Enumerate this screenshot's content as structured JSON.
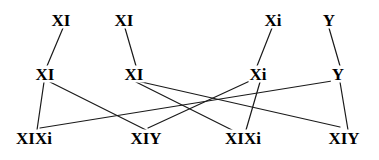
{
  "diagram": {
    "type": "genetic-cross-lattice",
    "title": "",
    "stroke_color": "#1a1a1a",
    "background_color": "#ffffff",
    "stroke_width": 1.2,
    "rows": [
      {
        "name": "top-row",
        "y": 20,
        "nodes": [
          {
            "id": "t1",
            "label": "XI",
            "x": 61
          },
          {
            "id": "t2",
            "label": "XI",
            "x": 124
          },
          {
            "id": "t3",
            "label": "Xi",
            "x": 273
          },
          {
            "id": "t4",
            "label": "Y",
            "x": 329
          }
        ]
      },
      {
        "name": "middle-row",
        "y": 74,
        "nodes": [
          {
            "id": "m1",
            "label": "XI",
            "x": 45
          },
          {
            "id": "m2",
            "label": "XI",
            "x": 134
          },
          {
            "id": "m3",
            "label": "Xi",
            "x": 258
          },
          {
            "id": "m4",
            "label": "Y",
            "x": 338
          }
        ]
      },
      {
        "name": "bottom-row",
        "y": 138,
        "nodes": [
          {
            "id": "b1",
            "label": "XIXi",
            "x": 34
          },
          {
            "id": "b2",
            "label": "XIY",
            "x": 146
          },
          {
            "id": "b3",
            "label": "XIXi",
            "x": 243
          },
          {
            "id": "b4",
            "label": "XIY",
            "x": 344
          }
        ]
      }
    ],
    "edges": [
      {
        "from": "t1",
        "to": "m1",
        "x1": 63,
        "y1": 28,
        "x2": 47,
        "y2": 66
      },
      {
        "from": "t2",
        "to": "m2",
        "x1": 125,
        "y1": 28,
        "x2": 136,
        "y2": 66
      },
      {
        "from": "t3",
        "to": "m3",
        "x1": 272,
        "y1": 28,
        "x2": 257,
        "y2": 66
      },
      {
        "from": "t4",
        "to": "m4",
        "x1": 329,
        "y1": 28,
        "x2": 340,
        "y2": 66
      },
      {
        "from": "m1",
        "to": "b1",
        "x1": 44,
        "y1": 82,
        "x2": 37,
        "y2": 130
      },
      {
        "from": "m1",
        "to": "b2",
        "x1": 50,
        "y1": 82,
        "x2": 146,
        "y2": 130
      },
      {
        "from": "m2",
        "to": "b3",
        "x1": 136,
        "y1": 82,
        "x2": 232,
        "y2": 130
      },
      {
        "from": "m2",
        "to": "b4",
        "x1": 137,
        "y1": 81,
        "x2": 340,
        "y2": 127
      },
      {
        "from": "m3",
        "to": "b2",
        "x1": 252,
        "y1": 80,
        "x2": 148,
        "y2": 128
      },
      {
        "from": "m3",
        "to": "b3",
        "x1": 260,
        "y1": 82,
        "x2": 246,
        "y2": 130
      },
      {
        "from": "m4",
        "to": "b1",
        "x1": 332,
        "y1": 81,
        "x2": 40,
        "y2": 128
      },
      {
        "from": "m4",
        "to": "b4",
        "x1": 340,
        "y1": 82,
        "x2": 348,
        "y2": 130
      }
    ]
  }
}
